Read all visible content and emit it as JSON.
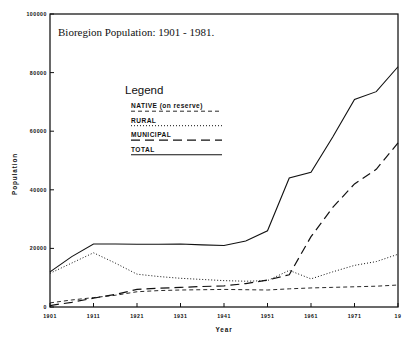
{
  "chart_data": {
    "type": "line",
    "title": "Bioregion Population:  1901 - 1981.",
    "xlabel": "Year",
    "ylabel": "Population",
    "xlim": [
      1901,
      1981
    ],
    "ylim": [
      0,
      100000
    ],
    "grid": false,
    "legend_position": "inside-upper-center",
    "legend_title": "Legend",
    "xticks": [
      "1901",
      "1911",
      "1921",
      "1931",
      "1941",
      "1951",
      "1961",
      "1971",
      "19"
    ],
    "xtick_values": [
      1901,
      1911,
      1921,
      1931,
      1941,
      1951,
      1961,
      1971,
      1981
    ],
    "yticks": [
      "0",
      "20000",
      "40000",
      "60000",
      "80000",
      "100000"
    ],
    "ytick_values": [
      0,
      20000,
      40000,
      60000,
      80000,
      100000
    ],
    "x": [
      1901,
      1906,
      1911,
      1916,
      1921,
      1926,
      1931,
      1936,
      1941,
      1946,
      1951,
      1956,
      1961,
      1966,
      1971,
      1976,
      1981
    ],
    "series": [
      {
        "name": "NATIVE (on reserve)",
        "style": "short-dash",
        "dasharray": "4 3",
        "width": 0.9,
        "values": [
          1400,
          2400,
          3200,
          4000,
          5200,
          5600,
          5800,
          5900,
          6000,
          5900,
          5800,
          6200,
          6500,
          6700,
          6900,
          7100,
          7500
        ]
      },
      {
        "name": "RURAL",
        "style": "dotted",
        "dasharray": "1 2",
        "width": 1.0,
        "values": [
          11500,
          15000,
          18500,
          15000,
          11200,
          10400,
          9800,
          9400,
          9000,
          8800,
          9000,
          12500,
          9600,
          12000,
          14200,
          15500,
          18000
        ]
      },
      {
        "name": "MUNICIPAL",
        "style": "long-dash",
        "dasharray": "9 5",
        "width": 1.2,
        "values": [
          500,
          1600,
          3000,
          4300,
          6000,
          6400,
          6700,
          7000,
          7200,
          8000,
          9200,
          11000,
          24000,
          34000,
          42000,
          47000,
          56000
        ]
      },
      {
        "name": "TOTAL",
        "style": "solid",
        "dasharray": "none",
        "width": 1.1,
        "values": [
          12000,
          17200,
          21500,
          21500,
          21400,
          21400,
          21500,
          21200,
          21000,
          22500,
          26000,
          44000,
          46000,
          58000,
          70800,
          73500,
          82000
        ]
      }
    ]
  },
  "legend": {
    "title": "Legend",
    "entries": [
      {
        "label": "NATIVE (on reserve)",
        "style": "short-dash"
      },
      {
        "label": "RURAL",
        "style": "dotted"
      },
      {
        "label": "MUNICIPAL",
        "style": "long-dash"
      },
      {
        "label": "TOTAL",
        "style": "solid"
      }
    ]
  }
}
